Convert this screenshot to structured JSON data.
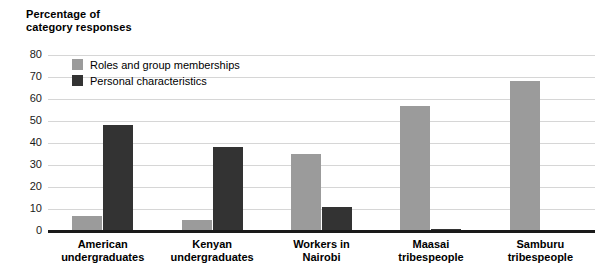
{
  "axis_title": {
    "line1": "Percentage of",
    "line2": "category responses"
  },
  "legend": {
    "items": [
      {
        "label": "Roles and group memberships",
        "color": "#9b9b9b"
      },
      {
        "label": "Personal characteristics",
        "color": "#333333"
      }
    ]
  },
  "yticks": [
    "80",
    "70",
    "60",
    "50",
    "40",
    "30",
    "20",
    "10",
    "0"
  ],
  "categories_display": [
    {
      "line1": "American",
      "line2": "undergraduates"
    },
    {
      "line1": "Kenyan",
      "line2": "undergraduates"
    },
    {
      "line1": "Workers in",
      "line2": "Nairobi"
    },
    {
      "line1": "Maasai",
      "line2": "tribespeople"
    },
    {
      "line1": "Samburu",
      "line2": "tribespeople"
    }
  ],
  "chart_data": {
    "type": "bar",
    "title": "",
    "xlabel": "",
    "ylabel": "Percentage of category responses",
    "ylim": [
      0,
      80
    ],
    "ytick_values": [
      0,
      10,
      20,
      30,
      40,
      50,
      60,
      70,
      80
    ],
    "grid": true,
    "legend_position": "top-left inside plot",
    "categories": [
      "American undergraduates",
      "Kenyan undergraduates",
      "Workers in Nairobi",
      "Maasai tribespeople",
      "Samburu tribespeople"
    ],
    "series": [
      {
        "name": "Roles and group memberships",
        "color": "#9b9b9b",
        "values": [
          7,
          5,
          35,
          57,
          68
        ]
      },
      {
        "name": "Personal characteristics",
        "color": "#333333",
        "values": [
          48,
          38,
          11,
          1,
          0
        ]
      }
    ]
  }
}
